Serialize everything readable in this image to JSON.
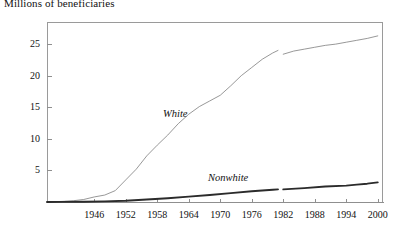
{
  "chart_data": {
    "type": "line",
    "title": "Millions of beneficiaries",
    "xlabel": "",
    "ylabel": "",
    "xlim": [
      1937,
      2001
    ],
    "ylim": [
      0,
      28.5
    ],
    "xticks": [
      1946,
      1952,
      1958,
      1964,
      1970,
      1976,
      1982,
      1988,
      1994,
      2000
    ],
    "yticks": [
      5,
      10,
      15,
      20,
      25
    ],
    "grid": false,
    "legend_position": "inline-annotation",
    "frame": "top-left-right",
    "series": [
      {
        "name": "White",
        "color": "#8c8c8c",
        "line_width": 0.9,
        "label_text": "White",
        "x": [
          1937,
          1940,
          1942,
          1944,
          1946,
          1948,
          1950,
          1952,
          1954,
          1956,
          1958,
          1960,
          1962,
          1964,
          1966,
          1968,
          1970,
          1972,
          1974,
          1976,
          1978,
          1980,
          1981
        ],
        "values": [
          0.0,
          0.1,
          0.2,
          0.4,
          0.8,
          1.1,
          1.8,
          3.5,
          5.2,
          7.3,
          9.0,
          10.6,
          12.4,
          13.9,
          15.1,
          16.0,
          16.9,
          18.4,
          20.0,
          21.3,
          22.6,
          23.6,
          24.0
        ]
      },
      {
        "name": "White",
        "color": "#8c8c8c",
        "line_width": 0.9,
        "label_text": "White",
        "x": [
          1982,
          1984,
          1986,
          1988,
          1990,
          1992,
          1994,
          1996,
          1998,
          2000
        ],
        "values": [
          23.4,
          23.9,
          24.2,
          24.5,
          24.8,
          25.0,
          25.3,
          25.6,
          25.9,
          26.3
        ]
      },
      {
        "name": "Nonwhite",
        "color": "#2b2b2b",
        "line_width": 1.9,
        "label_text": "Nonwhite",
        "x": [
          1937,
          1940,
          1944,
          1948,
          1952,
          1956,
          1960,
          1964,
          1968,
          1972,
          1976,
          1980,
          1981
        ],
        "values": [
          0.0,
          0.02,
          0.05,
          0.1,
          0.2,
          0.4,
          0.6,
          0.85,
          1.1,
          1.4,
          1.7,
          1.95,
          2.0
        ]
      },
      {
        "name": "Nonwhite",
        "color": "#2b2b2b",
        "line_width": 1.9,
        "label_text": "Nonwhite",
        "x": [
          1982,
          1986,
          1990,
          1994,
          1996,
          1998,
          2000
        ],
        "values": [
          2.0,
          2.2,
          2.45,
          2.6,
          2.75,
          2.9,
          3.1
        ]
      }
    ]
  },
  "axes": {
    "y_tick_labels": [
      "25",
      "20",
      "15",
      "10",
      "5"
    ],
    "x_tick_labels": [
      "1946",
      "1952",
      "1958",
      "1964",
      "1970",
      "1976",
      "1982",
      "1988",
      "1994",
      "2000"
    ]
  },
  "annotations": {
    "white": "White",
    "nonwhite": "Nonwhite"
  },
  "colors": {
    "white_series": "#8c8c8c",
    "nonwhite_series": "#2b2b2b",
    "axis": "#8f8f8f",
    "text": "#111111",
    "background": "#ffffff"
  }
}
